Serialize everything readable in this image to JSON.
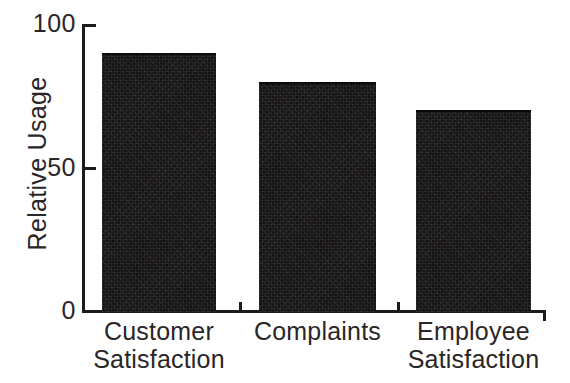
{
  "chart_data": {
    "type": "bar",
    "title": "",
    "subtitle": "",
    "xlabel": "",
    "ylabel": "Relative Usage",
    "ylim": [
      0,
      100
    ],
    "yticks": [
      0,
      50,
      100
    ],
    "ytick_labels": [
      "0",
      "50",
      "100"
    ],
    "grid": false,
    "legend": false,
    "legend_position": "none",
    "orientation": "vertical",
    "bar_color": "#131112",
    "axis_color": "#1c1a1b",
    "background": "#ffffff",
    "categories": [
      "Customer Satisfaction",
      "Complaints",
      "Employee Satisfaction"
    ],
    "category_lines": [
      [
        "Customer",
        "Satisfaction"
      ],
      [
        "Complaints",
        ""
      ],
      [
        "Employee",
        "Satisfaction"
      ]
    ],
    "values": [
      90,
      80,
      70
    ],
    "series": [
      {
        "name": "Relative Usage",
        "values": [
          90,
          80,
          70
        ]
      }
    ]
  },
  "axis": {
    "y_title": "Relative Usage",
    "tick_100": "100",
    "tick_50": "50",
    "tick_0": "0"
  },
  "categories": [
    {
      "line1": "Customer",
      "line2": "Satisfaction"
    },
    {
      "line1": "Complaints",
      "line2": ""
    },
    {
      "line1": "Employee",
      "line2": "Satisfaction"
    }
  ]
}
